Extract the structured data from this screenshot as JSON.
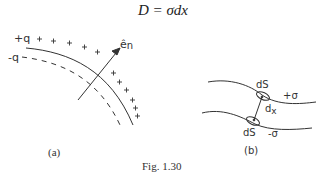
{
  "equation": "D = σdx",
  "figure": {
    "caption": "Fig. 1.30",
    "panel_a": {
      "label": "(a)",
      "charge_positive_label": "+q",
      "charge_negative_label": "-q",
      "normal_vector_label": "ê",
      "normal_vector_subscript": "n"
    },
    "panel_b": {
      "label": "(b)",
      "upper_area_label": "dS",
      "lower_area_label": "dS",
      "upper_charge_label": "+σ",
      "lower_charge_label": "-σ",
      "separation_label": "d",
      "separation_subscript": "x"
    }
  },
  "colors": {
    "ink": "#333333",
    "background": "#ffffff"
  }
}
